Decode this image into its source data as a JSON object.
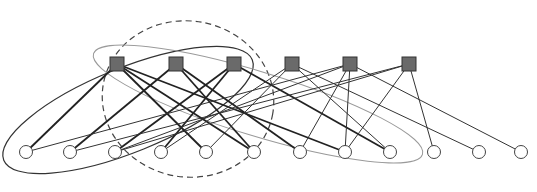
{
  "diagram": {
    "type": "bipartite-factor-graph",
    "colors": {
      "factor_fill": "#6a6a6a",
      "factor_stroke": "#333333",
      "variable_fill": "#ffffff",
      "variable_stroke": "#444444",
      "edge_thick": "#222222",
      "edge_thin": "#333333",
      "ellipse_solid": "#333333",
      "ellipse_dashed": "#444444",
      "ellipse_light": "#9a9a9a"
    },
    "factor_nodes": [
      {
        "id": "f1",
        "x": 117,
        "y": 64
      },
      {
        "id": "f2",
        "x": 176,
        "y": 64
      },
      {
        "id": "f3",
        "x": 234,
        "y": 64
      },
      {
        "id": "f4",
        "x": 292,
        "y": 64
      },
      {
        "id": "f5",
        "x": 350,
        "y": 64
      },
      {
        "id": "f6",
        "x": 409,
        "y": 64
      }
    ],
    "variable_nodes": [
      {
        "id": "v1",
        "x": 26,
        "y": 152
      },
      {
        "id": "v2",
        "x": 70,
        "y": 152
      },
      {
        "id": "v3",
        "x": 115,
        "y": 152
      },
      {
        "id": "v4",
        "x": 161,
        "y": 152
      },
      {
        "id": "v5",
        "x": 206,
        "y": 152
      },
      {
        "id": "v6",
        "x": 254,
        "y": 152
      },
      {
        "id": "v7",
        "x": 300,
        "y": 152
      },
      {
        "id": "v8",
        "x": 345,
        "y": 152
      },
      {
        "id": "v9",
        "x": 390,
        "y": 152
      },
      {
        "id": "v10",
        "x": 434,
        "y": 152
      },
      {
        "id": "v11",
        "x": 479,
        "y": 152
      },
      {
        "id": "v12",
        "x": 521,
        "y": 152
      }
    ],
    "edges": [
      {
        "from": "f1",
        "to": "v1",
        "weight": "thick"
      },
      {
        "from": "f1",
        "to": "v5",
        "weight": "thick"
      },
      {
        "from": "f1",
        "to": "v6",
        "weight": "thick"
      },
      {
        "from": "f1",
        "to": "v8",
        "weight": "thick"
      },
      {
        "from": "f2",
        "to": "v2",
        "weight": "thick"
      },
      {
        "from": "f2",
        "to": "v6",
        "weight": "thick"
      },
      {
        "from": "f2",
        "to": "v7",
        "weight": "thick"
      },
      {
        "from": "f3",
        "to": "v3",
        "weight": "thick"
      },
      {
        "from": "f3",
        "to": "v4",
        "weight": "thick"
      },
      {
        "from": "f3",
        "to": "v9",
        "weight": "thick"
      },
      {
        "from": "f4",
        "to": "v4",
        "weight": "thin"
      },
      {
        "from": "f4",
        "to": "v5",
        "weight": "thin"
      },
      {
        "from": "f4",
        "to": "v9",
        "weight": "thin"
      },
      {
        "from": "f4",
        "to": "v11",
        "weight": "thin"
      },
      {
        "from": "f5",
        "to": "v1",
        "weight": "thin"
      },
      {
        "from": "f5",
        "to": "v3",
        "weight": "thin"
      },
      {
        "from": "f5",
        "to": "v7",
        "weight": "thin"
      },
      {
        "from": "f5",
        "to": "v8",
        "weight": "thin"
      },
      {
        "from": "f5",
        "to": "v12",
        "weight": "thin"
      },
      {
        "from": "f6",
        "to": "v2",
        "weight": "thin"
      },
      {
        "from": "f6",
        "to": "v3",
        "weight": "thin"
      },
      {
        "from": "f6",
        "to": "v8",
        "weight": "thin"
      },
      {
        "from": "f6",
        "to": "v10",
        "weight": "thin"
      }
    ],
    "groups": [
      {
        "id": "group-solid",
        "style": "solid",
        "cx": 128,
        "cy": 110,
        "rx": 134,
        "ry": 42,
        "rotate": -22
      },
      {
        "id": "group-dashed",
        "style": "dashed",
        "cx": 188,
        "cy": 99,
        "rx": 86,
        "ry": 78,
        "rotate": 10
      },
      {
        "id": "group-light",
        "style": "light",
        "cx": 258,
        "cy": 104,
        "rx": 172,
        "ry": 32,
        "rotate": 17
      }
    ]
  },
  "caption": {
    "text": ""
  }
}
